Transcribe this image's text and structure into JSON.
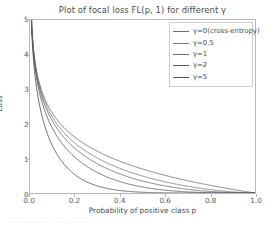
{
  "chart_data": {
    "type": "line",
    "title": "Plot of focal loss FL(p, 1) for different γ",
    "xlabel": "Probability of positive class p",
    "ylabel": "Loss",
    "xlim": [
      0.0,
      1.0
    ],
    "ylim": [
      0,
      5
    ],
    "xticks": [
      "0.0",
      "0.2",
      "0.4",
      "0.6",
      "0.8",
      "1.0"
    ],
    "xtick_values": [
      0.0,
      0.2,
      0.4,
      0.6,
      0.8,
      1.0
    ],
    "yticks": [
      "0",
      "1",
      "2",
      "3",
      "4",
      "5"
    ],
    "ytick_values": [
      0,
      1,
      2,
      3,
      4,
      5
    ],
    "grid": false,
    "legend_position": "upper right",
    "formula": "FL(p) = -(1-p)^gamma * log(p)",
    "x": [
      0.0067,
      0.02,
      0.04,
      0.06,
      0.08,
      0.1,
      0.15,
      0.2,
      0.25,
      0.3,
      0.35,
      0.4,
      0.45,
      0.5,
      0.55,
      0.6,
      0.65,
      0.7,
      0.75,
      0.8,
      0.85,
      0.9,
      0.95,
      0.98,
      1.0
    ],
    "series": [
      {
        "name": "γ=0(cross-entropy)",
        "gamma": 0,
        "color": "#6e6e6e",
        "values": [
          5.0,
          3.91,
          3.22,
          2.81,
          2.53,
          2.3,
          1.9,
          1.61,
          1.39,
          1.2,
          1.05,
          0.92,
          0.8,
          0.69,
          0.6,
          0.51,
          0.43,
          0.36,
          0.29,
          0.22,
          0.16,
          0.105,
          0.051,
          0.02,
          0.0
        ]
      },
      {
        "name": "γ=0.5",
        "gamma": 0.5,
        "color": "#7a7a7a",
        "values": [
          4.98,
          3.87,
          3.16,
          2.73,
          2.43,
          2.18,
          1.75,
          1.44,
          1.2,
          1.0,
          0.85,
          0.71,
          0.59,
          0.49,
          0.4,
          0.32,
          0.25,
          0.2,
          0.15,
          0.099,
          0.063,
          0.033,
          0.011,
          0.0028,
          0.0
        ]
      },
      {
        "name": "γ=1",
        "gamma": 1,
        "color": "#6a6a6a",
        "values": [
          4.97,
          3.83,
          3.09,
          2.64,
          2.33,
          2.07,
          1.62,
          1.29,
          1.04,
          0.84,
          0.68,
          0.55,
          0.44,
          0.35,
          0.27,
          0.205,
          0.15,
          0.108,
          0.073,
          0.045,
          0.024,
          0.0105,
          0.0026,
          0.0004,
          0.0
        ]
      },
      {
        "name": "γ=2",
        "gamma": 2,
        "color": "#5d5d5d",
        "values": [
          4.93,
          3.76,
          2.96,
          2.48,
          2.14,
          1.86,
          1.37,
          1.03,
          0.78,
          0.59,
          0.44,
          0.33,
          0.24,
          0.173,
          0.122,
          0.082,
          0.053,
          0.032,
          0.018,
          0.009,
          0.0036,
          0.0011,
          0.00013,
          8.1e-06,
          0.0
        ]
      },
      {
        "name": "γ=5",
        "gamma": 5,
        "color": "#555555",
        "values": [
          4.83,
          3.54,
          2.63,
          2.08,
          1.69,
          1.36,
          0.83,
          0.53,
          0.33,
          0.205,
          0.123,
          0.072,
          0.041,
          0.0216,
          0.011,
          0.0052,
          0.0023,
          0.00088,
          0.00028,
          7e-05,
          1.25e-05,
          1.05e-06,
          1.6e-08,
          0.0,
          0.0
        ]
      }
    ]
  },
  "legend": {
    "entries": [
      "γ=0(cross-entropy)",
      "γ=0.5",
      "γ=1",
      "γ=2",
      "γ=5"
    ]
  },
  "clipped_caption": "——— ——  —— ———"
}
